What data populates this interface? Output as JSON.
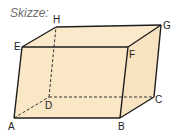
{
  "caption": "Skizze:",
  "figure": {
    "type": "parallelepiped",
    "fill_color": "#f9e7c6",
    "edge_color": "#1e1e1e",
    "vertices": {
      "A": {
        "label": "A",
        "x": 14,
        "y": 118
      },
      "B": {
        "label": "B",
        "x": 120,
        "y": 118
      },
      "C": {
        "label": "C",
        "x": 154,
        "y": 97
      },
      "D": {
        "label": "D",
        "x": 49,
        "y": 97
      },
      "E": {
        "label": "E",
        "x": 22,
        "y": 47
      },
      "F": {
        "label": "F",
        "x": 128,
        "y": 47
      },
      "G": {
        "label": "G",
        "x": 161,
        "y": 25
      },
      "H": {
        "label": "H",
        "x": 56,
        "y": 27
      }
    },
    "hidden_edges": [
      "AD",
      "DC",
      "DH"
    ]
  }
}
